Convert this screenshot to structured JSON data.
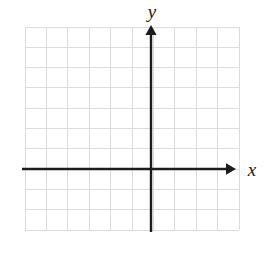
{
  "figure": {
    "type": "blank-cartesian-coordinate-grid",
    "background_color": "#ffffff",
    "width": 271,
    "height": 254
  },
  "grid": {
    "line_color": "#dcdcdc",
    "line_width": 1,
    "columns": 10,
    "rows": 10,
    "left": 25,
    "top": 27,
    "right": 239,
    "bottom": 230,
    "cell_width": 21.4,
    "cell_height": 20.3
  },
  "axes": {
    "color": "#1c1c1c",
    "line_width": 2.4,
    "origin": {
      "x": 151,
      "y": 169
    },
    "x_axis": {
      "label": "x",
      "start_x": 22,
      "end_x": 234,
      "y": 169,
      "arrow_end": "right"
    },
    "y_axis": {
      "label": "y",
      "x": 151,
      "start_y": 232,
      "end_y": 27,
      "arrow_end": "up"
    }
  },
  "ticks": {
    "visible": false,
    "tick_labels": []
  },
  "plotted_data": {
    "series": [],
    "points": [],
    "note": "empty grid — no curves or points drawn"
  }
}
